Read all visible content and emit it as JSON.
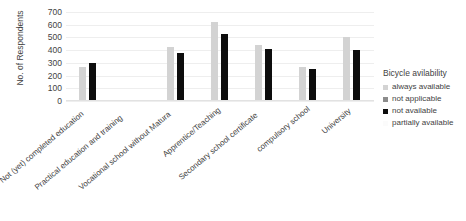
{
  "chart_data": {
    "type": "bar",
    "title": "",
    "xlabel": "",
    "ylabel": "No. of Respondents",
    "ylim": [
      0,
      700
    ],
    "ytick_step": 100,
    "yticks": [
      700,
      600,
      500,
      400,
      300,
      200,
      100,
      0
    ],
    "grid": true,
    "legend_position": "right",
    "legend_title": "Bicycle avilability",
    "categories": [
      "Not (yet) completed education",
      "Practical education and training",
      "Vocational school without Matura",
      "Apprentice/Teaching",
      "Secondary school certificate",
      "compulsory school",
      "University"
    ],
    "series": [
      {
        "name": "always available",
        "color": "#d3d3d3",
        "values": [
          265,
          0,
          425,
          625,
          440,
          270,
          500
        ]
      },
      {
        "name": "not applicable",
        "color": "#8c8c8c",
        "values": [
          0,
          0,
          0,
          0,
          0,
          0,
          0
        ]
      },
      {
        "name": "not available",
        "color": "#0d0d0d",
        "values": [
          300,
          0,
          380,
          525,
          410,
          250,
          405
        ]
      },
      {
        "name": "partially available",
        "color": "#f2f2f2",
        "values": [
          0,
          0,
          0,
          0,
          0,
          0,
          0
        ]
      }
    ]
  },
  "axis": {
    "y_title": "No. of Respondents",
    "y_ticks": [
      "700",
      "600",
      "500",
      "400",
      "300",
      "200",
      "100",
      "0"
    ]
  },
  "x_axis": {
    "labels": [
      "Not (yet) completed education",
      "Practical education and training",
      "Vocational school without Matura",
      "Apprentice/Teaching",
      "Secondary school certificate",
      "compulsory school",
      "University"
    ]
  },
  "legend": {
    "title": "Bicycle avilability",
    "items": [
      {
        "label": "always available",
        "color": "#d3d3d3"
      },
      {
        "label": "not applicable",
        "color": "#8c8c8c"
      },
      {
        "label": "not available",
        "color": "#0d0d0d"
      },
      {
        "label": "partially available",
        "color": "#f2f2f2"
      }
    ]
  }
}
